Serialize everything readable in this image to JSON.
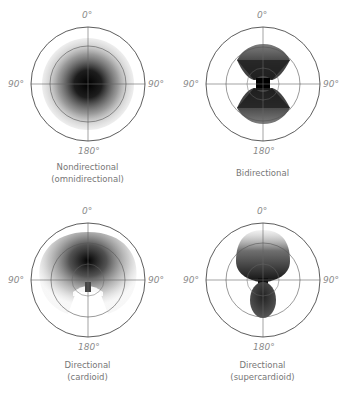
{
  "axis_labels": {
    "top": "0°",
    "left": "90°",
    "right": "90°",
    "bottom": "180°"
  },
  "panels": [
    {
      "caption_line1": "Nondirectional",
      "caption_line2": "(omnidirectional)",
      "pattern": "omnidirectional"
    },
    {
      "caption_line1": "Bidirectional",
      "caption_line2": "",
      "pattern": "figure-eight"
    },
    {
      "caption_line1": "Directional",
      "caption_line2": "(cardioid)",
      "pattern": "cardioid"
    },
    {
      "caption_line1": "Directional",
      "caption_line2": "(supercardioid)",
      "pattern": "supercardioid"
    }
  ],
  "colors": {
    "ring": "#333333",
    "grid": "#666666",
    "label": "#8a8a8a",
    "fill_dark": "#000000"
  }
}
